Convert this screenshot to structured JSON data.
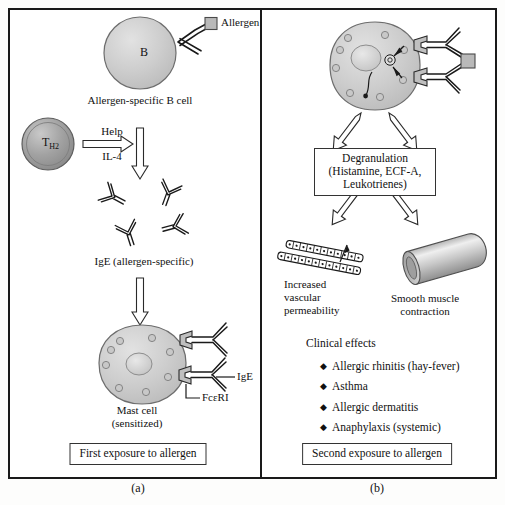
{
  "figure": {
    "panel_a_letter": "(a)",
    "panel_b_letter": "(b)"
  },
  "panel_a": {
    "allergen_label": "Allergen",
    "bcell_letter": "B",
    "bcell_caption": "Allergen-specific B cell",
    "th2_label_main": "T",
    "th2_label_sub": "H2",
    "arrow_help_top": "Help",
    "arrow_help_bottom": "IL-4",
    "ige_caption": "IgE (allergen-specific)",
    "mastcell_caption_line1": "Mast cell",
    "mastcell_caption_line2": "(sensitized)",
    "ige_receptor_label": "IgE",
    "fceri_label": "FcεRI",
    "bottom_box": "First exposure to allergen"
  },
  "panel_b": {
    "degranulation_line1": "Degranulation",
    "degranulation_line2": "(Histamine, ECF-A, Leukotrienes)",
    "vascular_line1": "Increased",
    "vascular_line2": "vascular",
    "vascular_line3": "permeability",
    "muscle_line1": "Smooth muscle",
    "muscle_line2": "contraction",
    "clinical_heading": "Clinical effects",
    "bullet_glyph": "◆",
    "clinical_effects": [
      "Allergic rhinitis (hay-fever)",
      "Asthma",
      "Allergic dermatitis",
      "Anaphylaxis (systemic)"
    ],
    "bottom_box": "Second exposure to allergen"
  },
  "colors": {
    "ink": "#1a1a1a",
    "cell_fill": "#cfcfcf",
    "cell_stroke": "#555555",
    "th2_fill": "#9a9a9a",
    "allergen_fill": "#b9b9b9",
    "granule_fill": "#c2c2c2",
    "page_background": "#ffffff"
  }
}
